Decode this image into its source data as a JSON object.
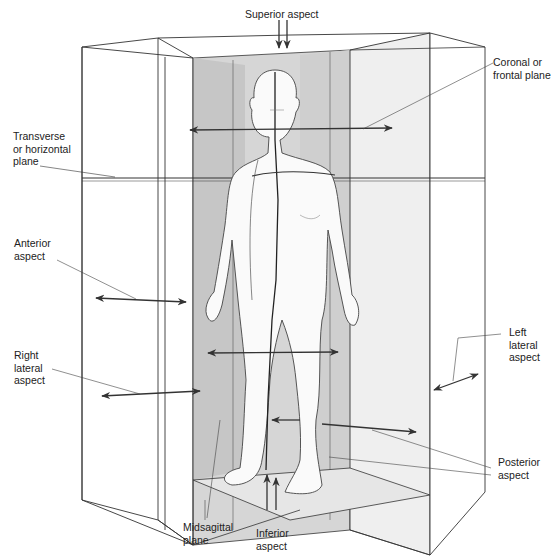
{
  "diagram": {
    "labels": {
      "superior": "Superior aspect",
      "coronal": "Coronal or\nfrontal plane",
      "transverse": "Transverse\nor horizontal\nplane",
      "anterior": "Anterior\naspect",
      "right_lateral": "Right\nlateral\naspect",
      "left_lateral": "Left\nlateral\naspect",
      "posterior": "Posterior\naspect",
      "midsagittal": "Midsagittal\nplane",
      "inferior": "Inferior\naspect"
    },
    "colors": {
      "line": "#333333",
      "plane_dark": "#c9c9c9",
      "plane_mid": "#dcdcdc",
      "plane_light": "#ececec",
      "background": "#ffffff"
    }
  }
}
